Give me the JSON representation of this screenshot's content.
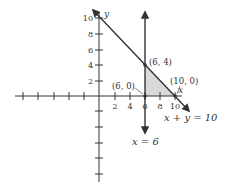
{
  "figure": {
    "axes": {
      "x_label": "x",
      "y_label": "y",
      "x_tick_labels": [
        "2",
        "4",
        "6",
        "8",
        "10"
      ],
      "y_tick_labels": [
        "2",
        "4",
        "6",
        "8",
        "10"
      ]
    },
    "lines": [
      {
        "equation": "x + y = 10",
        "label": "x + y = 10"
      },
      {
        "equation": "x = 6",
        "label": "x = 6"
      }
    ],
    "points": [
      {
        "label": "(6, 4)",
        "x": 6,
        "y": 4
      },
      {
        "label": "(6, 0)",
        "x": 6,
        "y": 0
      },
      {
        "label": "(10, 0)",
        "x": 10,
        "y": 0
      }
    ],
    "shaded_region": {
      "vertices": [
        [
          6,
          0
        ],
        [
          6,
          4
        ],
        [
          10,
          0
        ]
      ],
      "fill": "#d9d9d9"
    },
    "colors": {
      "line": "#333333",
      "shade": "#d9d9d9"
    }
  }
}
